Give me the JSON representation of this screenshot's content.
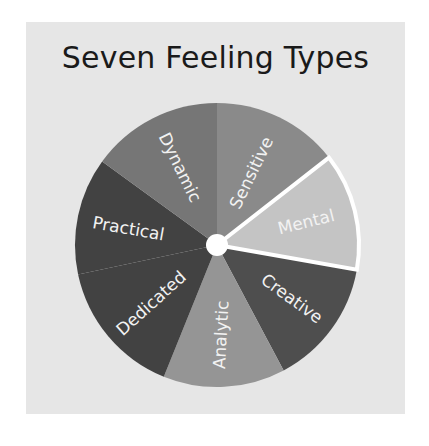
{
  "title": "Seven Feeling Types",
  "wheel": {
    "center": [
      217,
      245
    ],
    "radius": 142,
    "hub_color": "#ffffff",
    "highlight_color": "#ffffff",
    "segments": [
      {
        "label": "Sensitive",
        "start": 0,
        "end": 52,
        "color": "#8a8a8a",
        "label_r": 80,
        "label_angle": 26,
        "rotate": -64,
        "highlighted": false
      },
      {
        "label": "Mental",
        "start": 52,
        "end": 100,
        "color": "#c4c4c4",
        "label_r": 92,
        "label_angle": 76,
        "rotate": -14,
        "highlighted": true
      },
      {
        "label": "Creative",
        "start": 100,
        "end": 152,
        "color": "#4e4e4e",
        "label_r": 92,
        "label_angle": 126,
        "rotate": 36,
        "highlighted": false
      },
      {
        "label": "Analytic",
        "start": 152,
        "end": 202,
        "color": "#959595",
        "label_r": 90,
        "label_angle": 177,
        "rotate": -87,
        "highlighted": false
      },
      {
        "label": "Dedicated",
        "start": 202,
        "end": 258,
        "color": "#424242",
        "label_r": 88,
        "label_angle": 228,
        "rotate": -42,
        "highlighted": false
      },
      {
        "label": "Practical",
        "start": 258,
        "end": 306,
        "color": "#424242",
        "label_r": 90,
        "label_angle": 280,
        "rotate": 10,
        "highlighted": false
      },
      {
        "label": "Dynamic",
        "start": 306,
        "end": 360,
        "color": "#767676",
        "label_r": 86,
        "label_angle": 334,
        "rotate": 64,
        "highlighted": false
      }
    ]
  }
}
